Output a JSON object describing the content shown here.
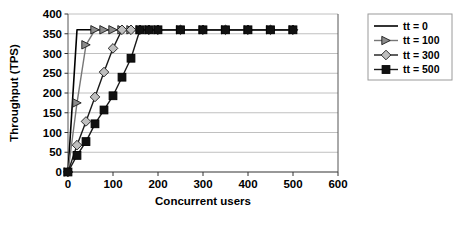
{
  "chart_data": {
    "type": "line",
    "title": "",
    "xlabel": "Concurrent users",
    "ylabel": "Throughput (TPS)",
    "xlim": [
      0,
      600
    ],
    "ylim": [
      0,
      400
    ],
    "xticks": [
      0,
      100,
      200,
      300,
      400,
      500,
      600
    ],
    "yticks": [
      0,
      50,
      100,
      150,
      200,
      250,
      300,
      350,
      400
    ],
    "grid": "horizontal",
    "legend_position": "right",
    "plateau_value": 360,
    "series": [
      {
        "name": "tt = 0",
        "marker": "none",
        "color": "#000000",
        "x": [
          0,
          20,
          40,
          60,
          80,
          100,
          120,
          140,
          160,
          180,
          200,
          250,
          300,
          350,
          400,
          450,
          500
        ],
        "y": [
          0,
          360,
          360,
          360,
          360,
          360,
          360,
          360,
          360,
          360,
          360,
          360,
          360,
          360,
          360,
          360,
          360
        ]
      },
      {
        "name": "tt = 100",
        "marker": "triangle",
        "color": "#808080",
        "x": [
          0,
          20,
          40,
          60,
          80,
          100,
          120,
          140,
          160,
          180,
          200,
          250,
          300,
          350,
          400,
          450,
          500
        ],
        "y": [
          0,
          175,
          322,
          360,
          360,
          360,
          360,
          360,
          360,
          360,
          360,
          360,
          360,
          360,
          360,
          360,
          360
        ]
      },
      {
        "name": "tt = 300",
        "marker": "diamond",
        "color": "#a6a6a6",
        "x": [
          0,
          20,
          40,
          60,
          80,
          100,
          120,
          140,
          160,
          180,
          200,
          250,
          300,
          350,
          400,
          450,
          500
        ],
        "y": [
          0,
          68,
          128,
          190,
          253,
          313,
          360,
          360,
          360,
          360,
          360,
          360,
          360,
          360,
          360,
          360,
          360
        ]
      },
      {
        "name": "tt = 500",
        "marker": "square",
        "color": "#000000",
        "x": [
          0,
          20,
          40,
          60,
          80,
          100,
          120,
          140,
          160,
          180,
          200,
          250,
          300,
          350,
          400,
          450,
          500
        ],
        "y": [
          0,
          42,
          77,
          122,
          157,
          193,
          240,
          288,
          360,
          360,
          360,
          360,
          360,
          360,
          360,
          360,
          360
        ]
      }
    ],
    "legend_entries": [
      {
        "label": "tt = 0",
        "marker": "none"
      },
      {
        "label": "tt = 100",
        "marker": "triangle"
      },
      {
        "label": "tt = 300",
        "marker": "diamond"
      },
      {
        "label": "tt = 500",
        "marker": "square"
      }
    ]
  }
}
